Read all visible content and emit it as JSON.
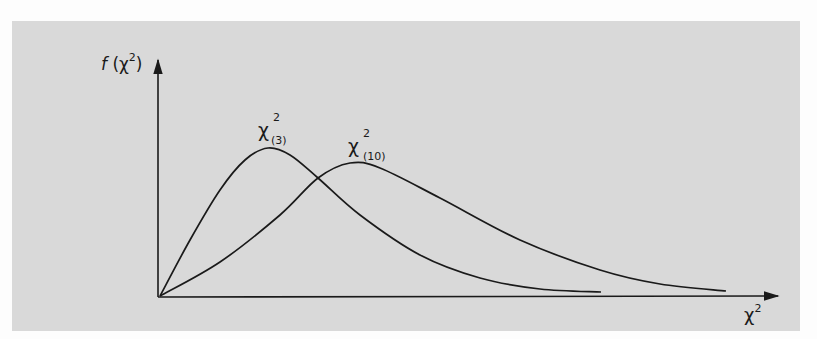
{
  "chart_data": {
    "type": "line",
    "title": "",
    "xlabel": "χ²",
    "ylabel": "f (χ²)",
    "grid": false,
    "legend": "inline labels near curve peaks",
    "axis_ticks": "none",
    "series": [
      {
        "name": "χ²(3)",
        "label_main": "χ",
        "label_sup": "2",
        "label_sub": "(3)",
        "description": "chi-square density, 3 degrees of freedom; steep rise, earlier and higher peak",
        "points_px": [
          [
            160,
            296
          ],
          [
            190,
            240
          ],
          [
            220,
            190
          ],
          [
            245,
            160
          ],
          [
            268,
            148
          ],
          [
            290,
            155
          ],
          [
            318,
            178
          ],
          [
            360,
            215
          ],
          [
            420,
            255
          ],
          [
            480,
            278
          ],
          [
            540,
            289
          ],
          [
            601,
            292
          ]
        ]
      },
      {
        "name": "χ²(10)",
        "label_main": "χ",
        "label_sup": "2",
        "label_sub": "(10)",
        "description": "chi-square density, 10 degrees of freedom; gentler rise, later and lower peak, longer tail",
        "points_px": [
          [
            160,
            296
          ],
          [
            220,
            262
          ],
          [
            280,
            215
          ],
          [
            318,
            178
          ],
          [
            350,
            163
          ],
          [
            380,
            168
          ],
          [
            440,
            198
          ],
          [
            520,
            240
          ],
          [
            600,
            270
          ],
          [
            660,
            284
          ],
          [
            726,
            291
          ]
        ]
      }
    ]
  },
  "axes": {
    "y_label": {
      "f": "f",
      "open": "(χ",
      "sup": "2",
      "close": ")"
    },
    "x_label": {
      "main": "χ",
      "sup": "2"
    }
  },
  "colors": {
    "panel": "#d9d9d9",
    "ink": "#1a1a1a",
    "page": "#fdfdfd"
  }
}
